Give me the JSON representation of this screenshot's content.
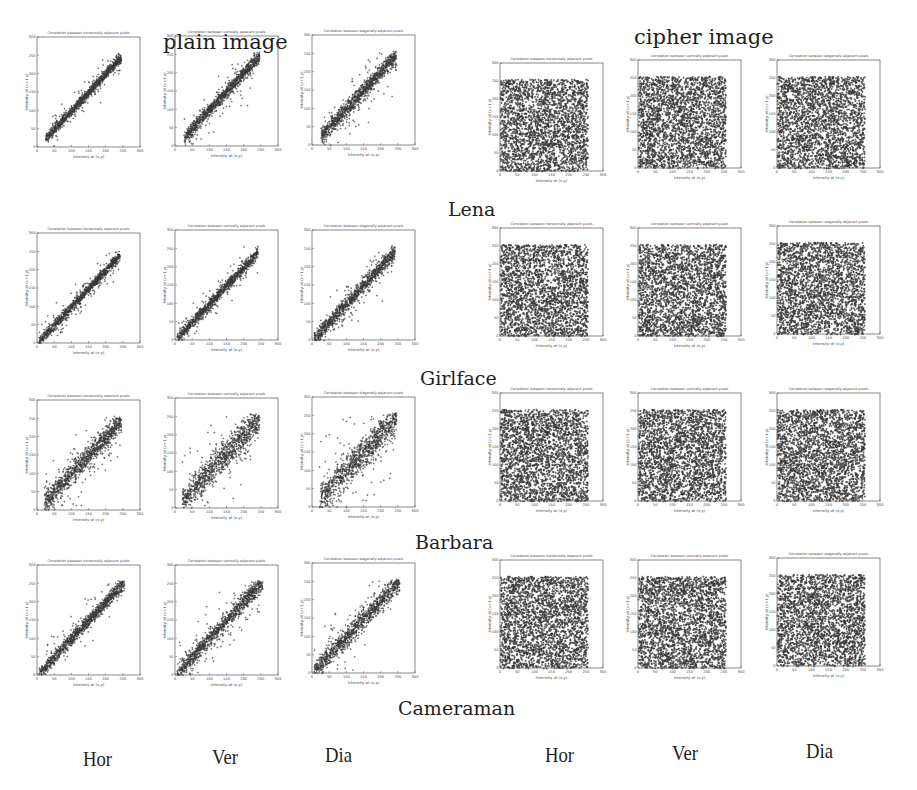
{
  "headers": {
    "plain": "plain image",
    "cipher": "cipher image"
  },
  "rows": [
    {
      "label": "Lena"
    },
    {
      "label": "Girlface"
    },
    {
      "label": "Barbara"
    },
    {
      "label": "Cameraman"
    }
  ],
  "columns": [
    "Hor",
    "Ver",
    "Dia",
    "Hor",
    "Ver",
    "Dia"
  ],
  "plot_text": {
    "titles": [
      "Correlation between horizontally adjacent pixels",
      "Correlation between vertically adjacent pixels",
      "Correlation between diagonally adjacent pixels"
    ],
    "xlabel": "Intensity at (x,y)",
    "ylabel": "Intensity at (x+1,y)"
  },
  "chart_data": {
    "type": "scatter",
    "xlabel": "Intensity at (x,y)",
    "ylabel": "Intensity of adjacent pixel",
    "xlim": [
      0,
      300
    ],
    "ylim": [
      0,
      300
    ],
    "xticks": [
      0,
      50,
      100,
      150,
      200,
      250,
      300
    ],
    "yticks": [
      0,
      50,
      100,
      150,
      200,
      250,
      300
    ],
    "grid": false,
    "panels": [
      {
        "image": "Lena",
        "type": "plain",
        "direction": "Hor",
        "correlation": 0.97,
        "range": [
          25,
          245
        ]
      },
      {
        "image": "Lena",
        "type": "plain",
        "direction": "Ver",
        "correlation": 0.95,
        "range": [
          25,
          245
        ]
      },
      {
        "image": "Lena",
        "type": "plain",
        "direction": "Dia",
        "correlation": 0.93,
        "range": [
          25,
          245
        ]
      },
      {
        "image": "Lena",
        "type": "cipher",
        "direction": "Hor",
        "correlation": 0.0,
        "range": [
          0,
          255
        ]
      },
      {
        "image": "Lena",
        "type": "cipher",
        "direction": "Ver",
        "correlation": 0.0,
        "range": [
          0,
          255
        ]
      },
      {
        "image": "Lena",
        "type": "cipher",
        "direction": "Dia",
        "correlation": 0.0,
        "range": [
          0,
          255
        ]
      },
      {
        "image": "Girlface",
        "type": "plain",
        "direction": "Hor",
        "correlation": 0.97,
        "range": [
          5,
          240
        ]
      },
      {
        "image": "Girlface",
        "type": "plain",
        "direction": "Ver",
        "correlation": 0.96,
        "range": [
          5,
          240
        ]
      },
      {
        "image": "Girlface",
        "type": "plain",
        "direction": "Dia",
        "correlation": 0.94,
        "range": [
          5,
          240
        ]
      },
      {
        "image": "Girlface",
        "type": "cipher",
        "direction": "Hor",
        "correlation": 0.0,
        "range": [
          0,
          255
        ]
      },
      {
        "image": "Girlface",
        "type": "cipher",
        "direction": "Ver",
        "correlation": 0.0,
        "range": [
          0,
          255
        ]
      },
      {
        "image": "Girlface",
        "type": "cipher",
        "direction": "Dia",
        "correlation": 0.0,
        "range": [
          0,
          255
        ]
      },
      {
        "image": "Barbara",
        "type": "plain",
        "direction": "Hor",
        "correlation": 0.9,
        "range": [
          20,
          245
        ]
      },
      {
        "image": "Barbara",
        "type": "plain",
        "direction": "Ver",
        "correlation": 0.86,
        "range": [
          20,
          245
        ]
      },
      {
        "image": "Barbara",
        "type": "plain",
        "direction": "Dia",
        "correlation": 0.84,
        "range": [
          20,
          245
        ]
      },
      {
        "image": "Barbara",
        "type": "cipher",
        "direction": "Hor",
        "correlation": 0.0,
        "range": [
          0,
          255
        ]
      },
      {
        "image": "Barbara",
        "type": "cipher",
        "direction": "Ver",
        "correlation": 0.0,
        "range": [
          0,
          255
        ]
      },
      {
        "image": "Barbara",
        "type": "cipher",
        "direction": "Dia",
        "correlation": 0.0,
        "range": [
          0,
          255
        ]
      },
      {
        "image": "Cameraman",
        "type": "plain",
        "direction": "Hor",
        "correlation": 0.95,
        "range": [
          5,
          255
        ]
      },
      {
        "image": "Cameraman",
        "type": "plain",
        "direction": "Ver",
        "correlation": 0.93,
        "range": [
          5,
          255
        ]
      },
      {
        "image": "Cameraman",
        "type": "plain",
        "direction": "Dia",
        "correlation": 0.91,
        "range": [
          5,
          255
        ]
      },
      {
        "image": "Cameraman",
        "type": "cipher",
        "direction": "Hor",
        "correlation": 0.0,
        "range": [
          0,
          255
        ]
      },
      {
        "image": "Cameraman",
        "type": "cipher",
        "direction": "Ver",
        "correlation": 0.0,
        "range": [
          0,
          255
        ]
      },
      {
        "image": "Cameraman",
        "type": "cipher",
        "direction": "Dia",
        "correlation": 0.0,
        "range": [
          0,
          255
        ]
      }
    ]
  }
}
